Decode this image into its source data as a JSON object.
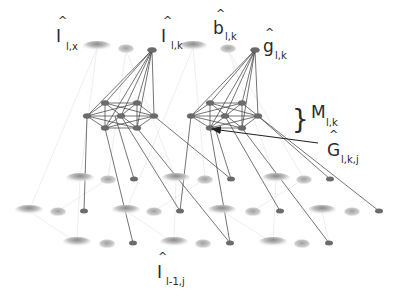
{
  "diagram": {
    "type": "hierarchical-network",
    "labels": {
      "i_lx": {
        "main": "I",
        "hat": "^",
        "sub": "l,x"
      },
      "i_lk": {
        "main": "I",
        "hat": "^",
        "sub": "l,k"
      },
      "b_lk": {
        "main": "b",
        "hat": "^",
        "sub": "l,k"
      },
      "g_lk": {
        "main": "g",
        "hat": "^",
        "sub": "l,k"
      },
      "m_lk": {
        "main": "M",
        "sub": "l,k",
        "brace": "}"
      },
      "G_lkj": {
        "main": "G",
        "hat": "^",
        "sub": "l,k,j"
      },
      "i_l1j": {
        "main": "I",
        "hat": "^",
        "sub": "l-1,j"
      }
    },
    "colors": {
      "node": "#6b6b6b",
      "edge": "#3a3a3a",
      "faint_edge": "#d8d8d8",
      "cloud": "#a8a8a8",
      "text": "#2a2a2a"
    }
  }
}
